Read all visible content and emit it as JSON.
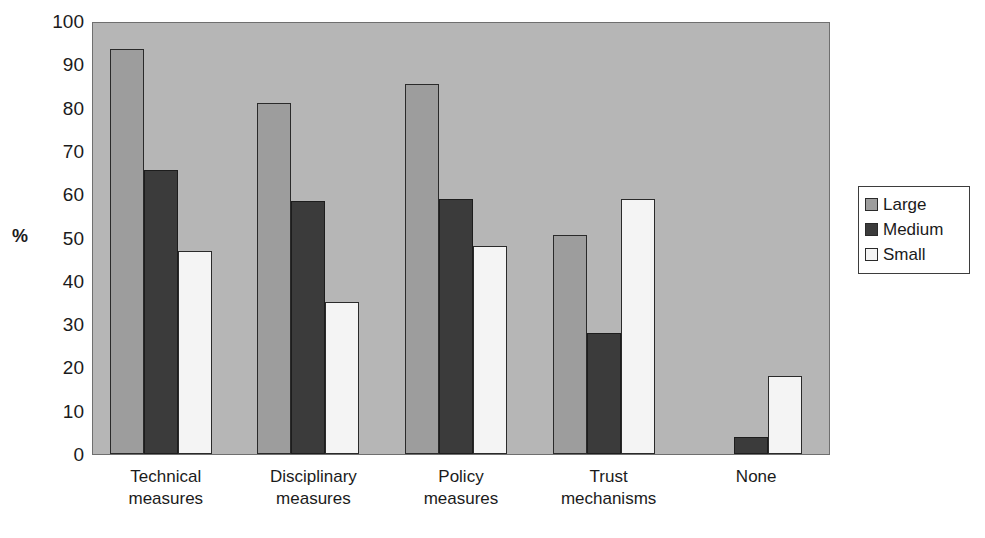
{
  "chart_data": {
    "type": "bar",
    "title": "",
    "xlabel": "",
    "ylabel": "%",
    "ylim": [
      0,
      100
    ],
    "y_ticks": [
      100,
      90,
      80,
      70,
      60,
      50,
      40,
      30,
      20,
      10,
      0
    ],
    "grid": false,
    "legend_position": "right",
    "categories": [
      "Technical measures",
      "Disciplinary measures",
      "Policy measures",
      "Trust mechanisms",
      "None"
    ],
    "category_lines": [
      [
        "Technical",
        "measures"
      ],
      [
        "Disciplinary",
        "measures"
      ],
      [
        "Policy",
        "measures"
      ],
      [
        "Trust",
        "mechanisms"
      ],
      [
        "None",
        ""
      ]
    ],
    "series": [
      {
        "name": "Large",
        "color": "#9d9d9d",
        "values": [
          93.5,
          81,
          85.5,
          50.5,
          0
        ]
      },
      {
        "name": "Medium",
        "color": "#3b3b3b",
        "values": [
          65.5,
          58.5,
          59,
          28,
          4
        ]
      },
      {
        "name": "Small",
        "color": "#f4f4f4",
        "values": [
          47,
          35,
          48,
          59,
          18
        ]
      }
    ]
  },
  "legend": {
    "items": [
      {
        "label": "Large"
      },
      {
        "label": "Medium"
      },
      {
        "label": "Small"
      }
    ]
  },
  "axis": {
    "y_title": "%"
  },
  "colors": {
    "plot_background": "#b6b6b6",
    "large": "#9d9d9d",
    "medium": "#3b3b3b",
    "small": "#f4f4f4",
    "outline": "#2a2a2a"
  },
  "scan_artifact": {
    "bleed_text": ""
  }
}
